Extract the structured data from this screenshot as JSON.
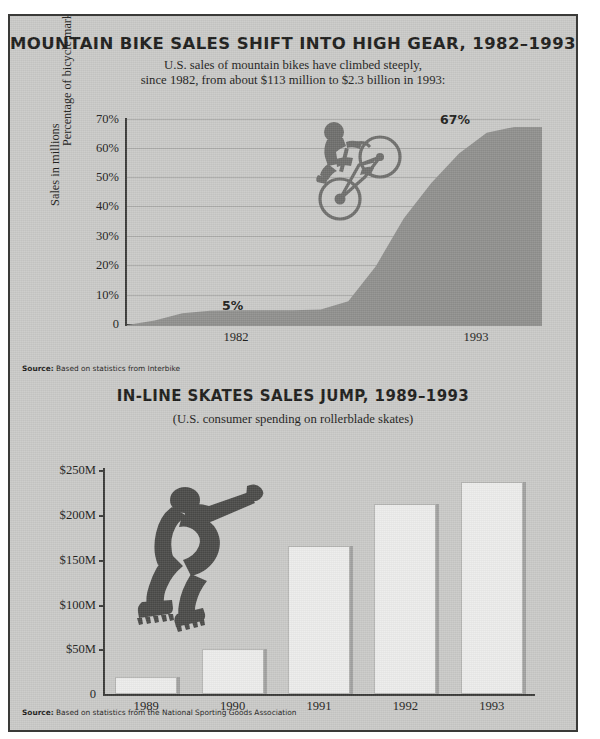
{
  "page": {
    "background_color": "#c9c9c7",
    "ink_color": "#1c1c1a",
    "area_fill_color": "#8f8f8d",
    "bar_fill_color": "#ececeb"
  },
  "chart1": {
    "title": "MOUNTAIN BIKE SALES SHIFT INTO HIGH GEAR, 1982–1993",
    "subtitle_line1": "U.S. sales of mountain bikes have climbed steeply,",
    "subtitle_line2": "since 1982, from about $113 million to $2.3 billion in 1993:",
    "ylabel": "Percentage of bicycle market",
    "yticks": [
      "70%",
      "60%",
      "50%",
      "40%",
      "30%",
      "20%",
      "10%",
      "0"
    ],
    "xticks": [
      "1982",
      "1993"
    ],
    "annotation_start": "5%",
    "annotation_end": "67%",
    "source_label": "Source:",
    "source_text": "Based on statistics from Interbike",
    "illustration": "mountain-biker-silhouette"
  },
  "chart2": {
    "title": "IN-LINE SKATES SALES JUMP, 1989–1993",
    "subtitle": "(U.S. consumer spending on rollerblade skates)",
    "ylabel": "Sales in millions",
    "yticks": [
      "$250M",
      "$200M",
      "$150M",
      "$100M",
      "$50M",
      "0"
    ],
    "source_label": "Source:",
    "source_text": "Based on statistics from the National Sporting Goods Association",
    "illustration": "inline-skater-silhouette"
  },
  "chart_data": [
    {
      "type": "area",
      "title": "MOUNTAIN BIKE SALES SHIFT INTO HIGH GEAR, 1982–1993",
      "subtitle": "U.S. sales of mountain bikes have climbed steeply, since 1982, from about $113 million to $2.3 billion in 1993:",
      "xlabel": "",
      "ylabel": "Percentage of bicycle market",
      "ylim": [
        0,
        70
      ],
      "xlim": [
        1980,
        1995
      ],
      "ytick_values": [
        0,
        10,
        20,
        30,
        40,
        50,
        60,
        70
      ],
      "ytick_labels": [
        "0",
        "10%",
        "20%",
        "30%",
        "40%",
        "50%",
        "60%",
        "70%"
      ],
      "xtick_values": [
        1982,
        1993
      ],
      "xtick_labels": [
        "1982",
        "1993"
      ],
      "grid": true,
      "legend": "none",
      "x": [
        1980,
        1981,
        1982,
        1983,
        1984,
        1985,
        1986,
        1987,
        1988,
        1989,
        1990,
        1991,
        1992,
        1993,
        1994,
        1995
      ],
      "values": [
        0,
        1.5,
        4,
        4.8,
        5,
        5,
        5,
        5.2,
        8,
        20,
        36,
        48,
        58,
        65,
        67,
        67
      ],
      "annotations": [
        {
          "text": "5%",
          "x": 1984,
          "y": 8
        },
        {
          "text": "67%",
          "x": 1993,
          "y": 70
        }
      ]
    },
    {
      "type": "bar",
      "title": "IN-LINE SKATES SALES JUMP, 1989–1993",
      "subtitle": "(U.S. consumer spending on rollerblade skates)",
      "xlabel": "",
      "ylabel": "Sales in millions",
      "ylim": [
        0,
        250
      ],
      "ytick_values": [
        0,
        50,
        100,
        150,
        200,
        250
      ],
      "ytick_labels": [
        "0",
        "$50M",
        "$100M",
        "$150M",
        "$200M",
        "$250M"
      ],
      "categories": [
        "1989",
        "1990",
        "1991",
        "1992",
        "1993"
      ],
      "values": [
        19,
        50,
        165,
        212,
        237
      ],
      "grid": false,
      "legend": "none",
      "units": "millions of U.S. dollars"
    }
  ]
}
